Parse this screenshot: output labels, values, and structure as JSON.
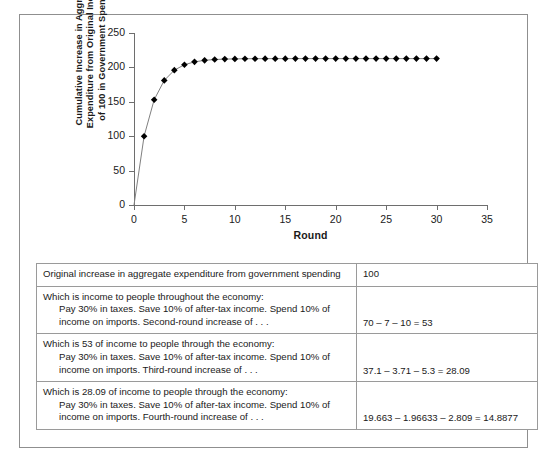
{
  "chart_data": {
    "type": "line",
    "title": "",
    "xlabel": "Round",
    "ylabel": "Cumulative Increase in Aggregate Expenditure from Original Increase of 100 in Government Spending",
    "ylabel_lines": [
      "Cumulative Increase in Aggregate",
      "Expenditure from Original Increase",
      "of 100 in Government Spending"
    ],
    "xlim": [
      0,
      35
    ],
    "ylim": [
      0,
      250
    ],
    "xticks": [
      0,
      5,
      10,
      15,
      20,
      25,
      30,
      35
    ],
    "yticks": [
      0,
      50,
      100,
      150,
      200,
      250
    ],
    "grid": false,
    "legend": "none",
    "marker": "diamond",
    "marker_color": "#000000",
    "line_color": "#808080",
    "x": [
      0,
      1,
      2,
      3,
      4,
      5,
      6,
      7,
      8,
      9,
      10,
      11,
      12,
      13,
      14,
      15,
      16,
      17,
      18,
      19,
      20,
      21,
      22,
      23,
      24,
      25,
      26,
      27,
      28,
      29,
      30
    ],
    "values": [
      0,
      100,
      153,
      181.09,
      195.98,
      203.87,
      208.05,
      210.27,
      211.44,
      212.06,
      212.39,
      212.57,
      212.66,
      212.71,
      212.74,
      212.75,
      212.76,
      212.76,
      212.77,
      212.77,
      212.77,
      212.77,
      212.77,
      212.77,
      212.77,
      212.77,
      212.77,
      212.77,
      212.77,
      212.77,
      212.77
    ],
    "origin_point_shown": false
  },
  "table": {
    "columns": [
      "Description",
      "Value"
    ],
    "rows": [
      {
        "lead": "Original increase in aggregate expenditure from government spending",
        "detail": "",
        "value": "100"
      },
      {
        "lead": "Which is income to people throughout the economy:",
        "detail": "Pay 30% in taxes. Save 10% of after-tax income. Spend 10% of income on imports. Second-round increase of . . .",
        "value": "70 – 7 – 10 = 53"
      },
      {
        "lead": "Which is 53 of income to people through the economy:",
        "detail": "Pay 30% in taxes. Save 10% of after-tax income. Spend 10% of income on imports. Third-round increase of . . .",
        "value": "37.1 – 3.71 – 5.3 = 28.09"
      },
      {
        "lead": "Which is 28.09 of income to people through the economy:",
        "detail": "Pay 30% in taxes. Save 10% of after-tax income. Spend 10% of income on imports. Fourth-round increase of . . .",
        "value": "19.663 – 1.96633 – 2.809 = 14.8877"
      }
    ]
  },
  "colors": {
    "frame": "#8f8f8f",
    "axis": "#6e6e6e",
    "table_border": "#9a9a9a",
    "text": "#1a1a1a",
    "background": "#ffffff"
  }
}
